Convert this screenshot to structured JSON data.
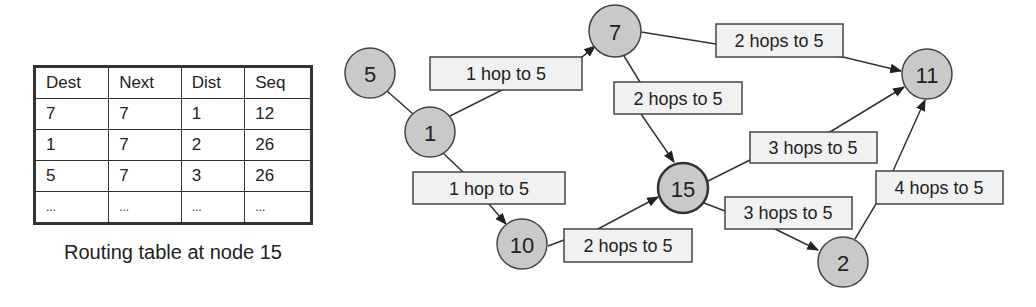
{
  "table": {
    "headers": [
      "Dest",
      "Next",
      "Dist",
      "Seq"
    ],
    "rows": [
      [
        "7",
        "7",
        "1",
        "12"
      ],
      [
        "1",
        "7",
        "2",
        "26"
      ],
      [
        "5",
        "7",
        "3",
        "26"
      ],
      [
        "...",
        "...",
        "...",
        "..."
      ]
    ],
    "caption": "Routing table at node 15"
  },
  "diagram": {
    "nodes": [
      {
        "id": "5",
        "label": "5",
        "x": 370,
        "y": 73
      },
      {
        "id": "1",
        "label": "1",
        "x": 430,
        "y": 132
      },
      {
        "id": "7",
        "label": "7",
        "x": 615,
        "y": 31
      },
      {
        "id": "11",
        "label": "11",
        "x": 927,
        "y": 74
      },
      {
        "id": "15",
        "label": "15",
        "x": 683,
        "y": 188,
        "focus": true
      },
      {
        "id": "10",
        "label": "10",
        "x": 522,
        "y": 244
      },
      {
        "id": "2",
        "label": "2",
        "x": 843,
        "y": 262
      }
    ],
    "labels": [
      {
        "text": "1 hop to 5",
        "edge": "1-7"
      },
      {
        "text": "2 hops to 5",
        "edge": "7-11"
      },
      {
        "text": "2 hops to 5",
        "edge": "7-15"
      },
      {
        "text": "1 hop to 5",
        "edge": "1-10"
      },
      {
        "text": "2 hops to 5",
        "edge": "10-15"
      },
      {
        "text": "3 hops to 5",
        "edge": "15-11"
      },
      {
        "text": "3 hops to 5",
        "edge": "15-2"
      },
      {
        "text": "4 hops to 5",
        "edge": "2-11"
      }
    ],
    "edges": [
      {
        "from": "5",
        "to": "1",
        "directed": false
      },
      {
        "from": "1",
        "to": "7",
        "directed": true
      },
      {
        "from": "7",
        "to": "11",
        "directed": true
      },
      {
        "from": "7",
        "to": "15",
        "directed": true
      },
      {
        "from": "1",
        "to": "10",
        "directed": true
      },
      {
        "from": "10",
        "to": "15",
        "directed": true
      },
      {
        "from": "15",
        "to": "11",
        "directed": true
      },
      {
        "from": "15",
        "to": "2",
        "directed": true
      },
      {
        "from": "2",
        "to": "11",
        "directed": true
      }
    ]
  }
}
